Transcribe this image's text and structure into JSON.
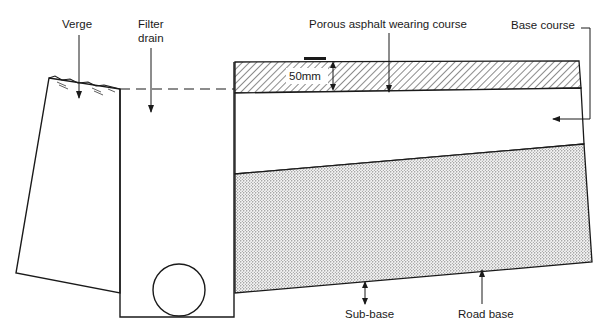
{
  "diagram": {
    "labels": {
      "verge": "Verge",
      "filter_drain_line1": "Filter",
      "filter_drain_line2": "drain",
      "wearing_course": "Porous asphalt wearing course",
      "base_course": "Base course",
      "thickness": "50mm",
      "sub_base": "Sub-base",
      "road_base": "Road base"
    },
    "layers": [
      {
        "name": "Porous asphalt wearing course",
        "pattern": "diagonal-hatch",
        "thickness": "50mm"
      },
      {
        "name": "Base course",
        "pattern": "none"
      },
      {
        "name": "Road base",
        "pattern": "stipple"
      },
      {
        "name": "Sub-base",
        "pattern": "none"
      }
    ],
    "colors": {
      "line": "#1a1a1a",
      "background": "#ffffff"
    }
  }
}
